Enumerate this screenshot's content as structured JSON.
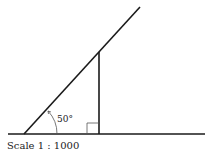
{
  "diagram": {
    "angle_label": "50°",
    "scale_label": "Scale 1 : 1000",
    "elements": [
      "ground-line",
      "sloped-line",
      "vertical-line",
      "right-angle-marker",
      "angle-arc"
    ],
    "colors": {
      "stroke": "#1a1a1a",
      "text": "#222222",
      "background": "#ffffff"
    }
  }
}
